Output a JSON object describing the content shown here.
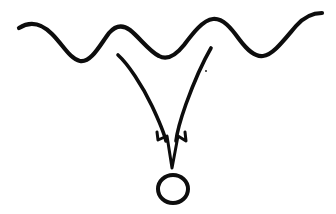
{
  "canvas": {
    "width": 336,
    "height": 214,
    "background_color": "#ffffff",
    "ink_color": "#0d0d0d",
    "title": "hand-drawn sketch: wavy line with curved arrow pointing at circle"
  },
  "figure": {
    "type": "freehand-diagram",
    "elements": [
      {
        "name": "wavy-line",
        "description": "hand-drawn sinuous horizontal wave across the top",
        "stroke_width": 4.2,
        "path": "M19,28 C30,21 41,23 52,34 C63,45 70,59 80,61 C91,63 100,45 109,33 C115,26 122,24 130,30 C140,38 149,51 159,56 C168,61 176,55 184,45 C193,33 203,20 213,19 C223,18 231,28 239,39 C248,51 255,57 263,56 C273,55 284,40 296,26 C303,18 312,13 322,13"
      },
      {
        "name": "arrow-left-curve",
        "description": "left stroke of the arrow shaft curving down and right",
        "stroke_width": 3.6,
        "path": "M118,55 C128,64 142,85 152,106 C160,123 164,133 166,141"
      },
      {
        "name": "arrow-right-curve",
        "description": "right stroke of the arrow shaft curving down and left",
        "stroke_width": 3.6,
        "path": "M211,48 C204,60 194,82 186,104 C180,121 177,132 176,141"
      },
      {
        "name": "arrow-head",
        "description": "open outlined V-shaped arrowhead pointing down",
        "stroke_width": 3.0,
        "path": "M157,132 L158,140 L167,136 L172,168 L178,136 L186,141 L185,132"
      },
      {
        "name": "target-circle",
        "description": "small hand-drawn open circle below the arrow tip",
        "stroke_width": 4.0,
        "path": "M173,175 C181,175 188,181 188,189 C188,197 181,203 173,203 C165,203 158,197 158,189 C158,181 165,175 173,175 Z"
      },
      {
        "name": "stray-dot",
        "description": "tiny ink speck to the right of the arrow shaft",
        "cx": 206,
        "cy": 71,
        "r": 0.9
      }
    ]
  }
}
